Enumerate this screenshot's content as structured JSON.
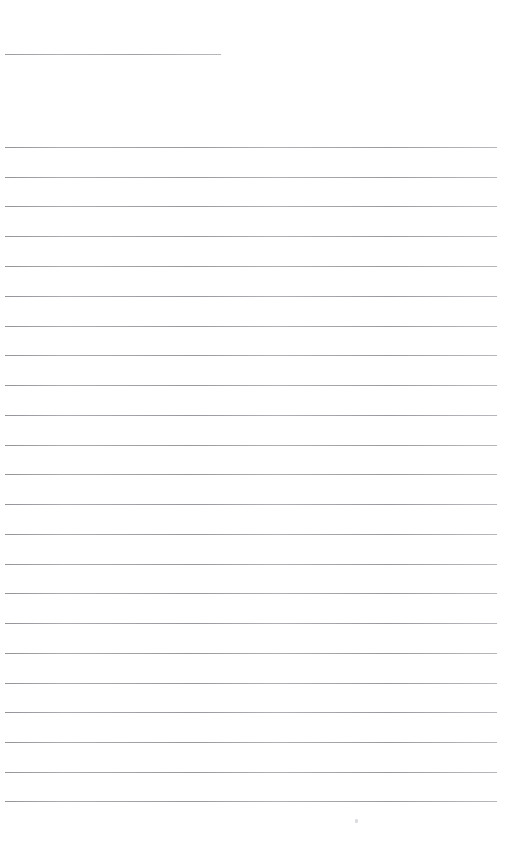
{
  "document": {
    "kind": "blank-ruled-notebook-page",
    "title": "",
    "page_width": 522,
    "page_height": 847,
    "background_color": "#ffffff",
    "rule_color": "#b4b4b8",
    "rule_thickness_px": 1,
    "text_content": "",
    "visible_text_lines": []
  },
  "header_rule": {
    "name": "header-underline",
    "x": 5,
    "y": 54,
    "width": 216,
    "content": ""
  },
  "body_rules": {
    "name": "ruled-lines",
    "count": 23,
    "x": 5,
    "width": 492,
    "first_y": 147,
    "spacing": 29.7,
    "lines": [
      {
        "index": 1,
        "y": 147,
        "content": ""
      },
      {
        "index": 2,
        "y": 177,
        "content": ""
      },
      {
        "index": 3,
        "y": 206,
        "content": ""
      },
      {
        "index": 4,
        "y": 236,
        "content": ""
      },
      {
        "index": 5,
        "y": 266,
        "content": ""
      },
      {
        "index": 6,
        "y": 296,
        "content": ""
      },
      {
        "index": 7,
        "y": 326,
        "content": ""
      },
      {
        "index": 8,
        "y": 355,
        "content": ""
      },
      {
        "index": 9,
        "y": 385,
        "content": ""
      },
      {
        "index": 10,
        "y": 415,
        "content": ""
      },
      {
        "index": 11,
        "y": 445,
        "content": ""
      },
      {
        "index": 12,
        "y": 474,
        "content": ""
      },
      {
        "index": 13,
        "y": 504,
        "content": ""
      },
      {
        "index": 14,
        "y": 534,
        "content": ""
      },
      {
        "index": 15,
        "y": 564,
        "content": ""
      },
      {
        "index": 16,
        "y": 593,
        "content": ""
      },
      {
        "index": 17,
        "y": 623,
        "content": ""
      },
      {
        "index": 18,
        "y": 653,
        "content": ""
      },
      {
        "index": 19,
        "y": 683,
        "content": ""
      },
      {
        "index": 20,
        "y": 712,
        "content": ""
      },
      {
        "index": 21,
        "y": 742,
        "content": ""
      },
      {
        "index": 22,
        "y": 772,
        "content": ""
      },
      {
        "index": 23,
        "y": 801,
        "content": ""
      }
    ]
  },
  "artifacts": [
    {
      "name": "scan-speck",
      "x": 355,
      "y": 819,
      "width": 3,
      "height": 4
    }
  ]
}
